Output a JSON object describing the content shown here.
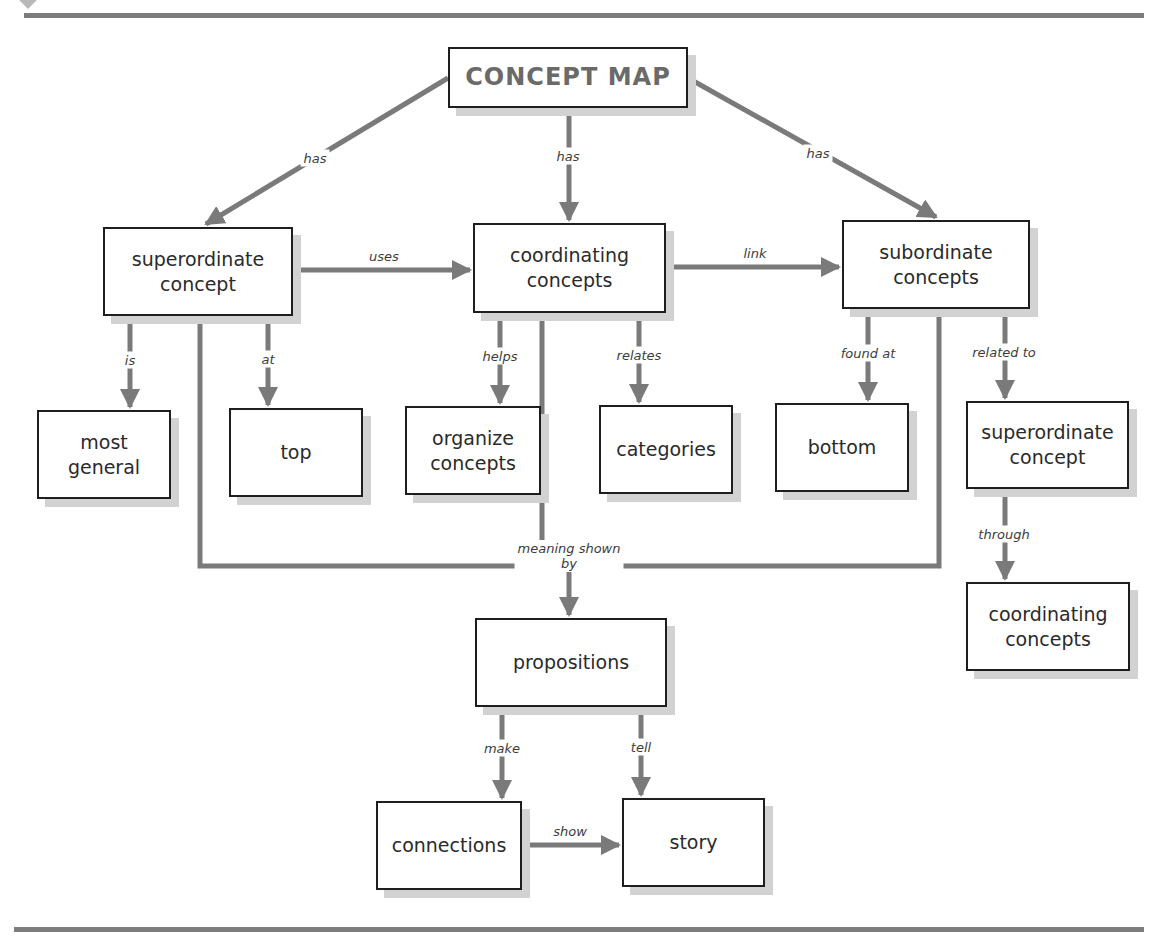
{
  "header": {
    "title_partial": "",
    "accent_color": "#7d7d7d"
  },
  "nodes": {
    "concept_map": "CONCEPT MAP",
    "superordinate": "superordinate\nconcept",
    "coordinating": "coordinating\nconcepts",
    "subordinate": "subordinate\nconcepts",
    "most_general": "most\ngeneral",
    "top": "top",
    "organize": "organize\nconcepts",
    "categories": "categories",
    "bottom": "bottom",
    "superordinate_right": "superordinate\nconcept",
    "coordinating_right": "coordinating\nconcepts",
    "propositions": "propositions",
    "connections": "connections",
    "story": "story"
  },
  "links": {
    "has_left": "has",
    "has_center": "has",
    "has_right": "has",
    "uses": "uses",
    "link": "link",
    "is": "is",
    "at": "at",
    "helps": "helps",
    "relates": "relates",
    "found_at": "found at",
    "related_to": "related to",
    "through": "through",
    "meaning_shown_by": "meaning shown\nby",
    "make": "make",
    "tell": "tell",
    "show": "show"
  },
  "colors": {
    "line": "#7a7a7a",
    "border": "#1e1e1e",
    "shadow": "#d2d2d2",
    "title_text": "#6a6a6a"
  }
}
